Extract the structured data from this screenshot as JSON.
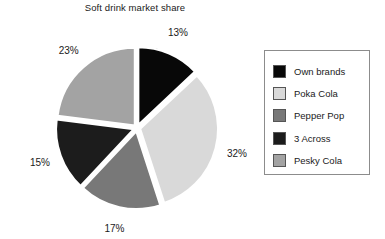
{
  "chart_data": {
    "type": "pie",
    "title": "Soft drink market share",
    "xlabel": "",
    "ylabel": "",
    "legend_position": "right",
    "grid": false,
    "exploded": true,
    "start_angle_deg": 0,
    "direction": "clockwise",
    "categories": [
      "Own brands",
      "Poka Cola",
      "Pepper Pop",
      "3 Across",
      "Pesky Cola"
    ],
    "values": [
      13,
      32,
      17,
      15,
      23
    ],
    "value_unit": "%",
    "data_labels": [
      "13%",
      "32%",
      "17%",
      "15%",
      "23%"
    ],
    "colors": [
      "#080808",
      "#d9d9d9",
      "#787878",
      "#1c1c1c",
      "#a3a3a3"
    ],
    "slices": [
      {
        "label": "Own brands",
        "value": 13,
        "data_label": "13%",
        "color": "#080808"
      },
      {
        "label": "Poka Cola",
        "value": 32,
        "data_label": "32%",
        "color": "#d9d9d9"
      },
      {
        "label": "Pepper Pop",
        "value": 17,
        "data_label": "17%",
        "color": "#787878"
      },
      {
        "label": "3 Across",
        "value": 15,
        "data_label": "15%",
        "color": "#1c1c1c"
      },
      {
        "label": "Pesky Cola",
        "value": 23,
        "data_label": "23%",
        "color": "#a3a3a3"
      }
    ]
  },
  "legend": {
    "items": [
      {
        "label": "Own brands",
        "color": "#080808"
      },
      {
        "label": "Poka Cola",
        "color": "#d9d9d9"
      },
      {
        "label": "Pepper Pop",
        "color": "#787878"
      },
      {
        "label": "3 Across",
        "color": "#1c1c1c"
      },
      {
        "label": "Pesky Cola",
        "color": "#a3a3a3"
      }
    ]
  },
  "style": {
    "background": "#ffffff",
    "text_color": "#1a1a1a",
    "legend_border": "#8c8c8c",
    "slice_gap_color": "#ffffff"
  }
}
